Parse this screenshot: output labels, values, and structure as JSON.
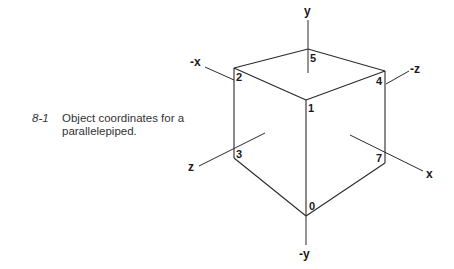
{
  "figure": {
    "number": "8-1",
    "caption_line1": "Object coordinates for a",
    "caption_line2": "parallelepiped."
  },
  "diagram": {
    "vertices": [
      "0",
      "1",
      "2",
      "3",
      "4",
      "5",
      "7"
    ],
    "axes": {
      "y_pos": "y",
      "y_neg": "-y",
      "x_pos": "x",
      "x_neg": "-x",
      "z_pos": "z",
      "z_neg": "-z"
    },
    "edges": [
      [
        "5",
        "2"
      ],
      [
        "5",
        "4"
      ],
      [
        "2",
        "1"
      ],
      [
        "4",
        "1"
      ],
      [
        "2",
        "3"
      ],
      [
        "1",
        "0"
      ],
      [
        "4",
        "7"
      ],
      [
        "3",
        "0"
      ],
      [
        "7",
        "0"
      ]
    ]
  },
  "colors": {
    "ink": "#2a2a2a",
    "caption": "#333333",
    "background": "#ffffff"
  }
}
